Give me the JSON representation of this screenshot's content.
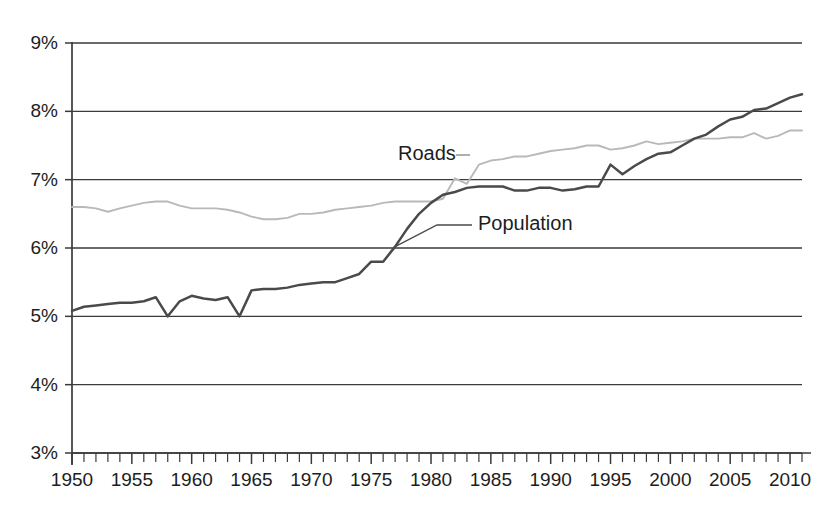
{
  "chart_data": {
    "type": "line",
    "title": "",
    "subtitle": "",
    "xlabel": "",
    "ylabel": "",
    "xlim": [
      1950,
      2011
    ],
    "ylim": [
      3,
      9
    ],
    "grid": true,
    "grid_axis": "y",
    "legend_position": "inline-annotations",
    "y_tick_labels": [
      "9%",
      "8%",
      "7%",
      "6%",
      "5%",
      "4%",
      "3%"
    ],
    "y_tick_values": [
      9,
      8,
      7,
      6,
      5,
      4,
      3
    ],
    "x_tick_labels": [
      "1950",
      "1955",
      "1960",
      "1965",
      "1970",
      "1975",
      "1980",
      "1985",
      "1990",
      "1995",
      "2000",
      "2005",
      "2010"
    ],
    "x_tick_values": [
      1950,
      1955,
      1960,
      1965,
      1970,
      1975,
      1980,
      1985,
      1990,
      1995,
      2000,
      2005,
      2010
    ],
    "x_minor_tick_step": 1,
    "y_unit": "percent",
    "x": [
      1950,
      1951,
      1952,
      1953,
      1954,
      1955,
      1956,
      1957,
      1958,
      1959,
      1960,
      1961,
      1962,
      1963,
      1964,
      1965,
      1966,
      1967,
      1968,
      1969,
      1970,
      1971,
      1972,
      1973,
      1974,
      1975,
      1976,
      1977,
      1978,
      1979,
      1980,
      1981,
      1982,
      1983,
      1984,
      1985,
      1986,
      1987,
      1988,
      1989,
      1990,
      1991,
      1992,
      1993,
      1994,
      1995,
      1996,
      1997,
      1998,
      1999,
      2000,
      2001,
      2002,
      2003,
      2004,
      2005,
      2006,
      2007,
      2008,
      2009,
      2010,
      2011
    ],
    "series": [
      {
        "name": "Roads",
        "color": "#b9b9b9",
        "annotation_label": "Roads",
        "values": [
          6.6,
          6.6,
          6.58,
          6.53,
          6.58,
          6.62,
          6.66,
          6.68,
          6.68,
          6.62,
          6.58,
          6.58,
          6.58,
          6.56,
          6.52,
          6.46,
          6.42,
          6.42,
          6.44,
          6.5,
          6.5,
          6.52,
          6.56,
          6.58,
          6.6,
          6.62,
          6.66,
          6.68,
          6.68,
          6.68,
          6.68,
          6.72,
          7.02,
          6.94,
          7.22,
          7.28,
          7.3,
          7.34,
          7.34,
          7.38,
          7.42,
          7.44,
          7.46,
          7.5,
          7.5,
          7.44,
          7.46,
          7.5,
          7.56,
          7.52,
          7.54,
          7.56,
          7.6,
          7.6,
          7.6,
          7.62,
          7.62,
          7.68,
          7.6,
          7.64,
          7.72,
          7.72
        ]
      },
      {
        "name": "Population",
        "color": "#4a4a4a",
        "annotation_label": "Population",
        "values": [
          5.08,
          5.14,
          5.16,
          5.18,
          5.2,
          5.2,
          5.22,
          5.28,
          5.0,
          5.22,
          5.3,
          5.26,
          5.24,
          5.28,
          5.0,
          5.38,
          5.4,
          5.4,
          5.42,
          5.46,
          5.48,
          5.5,
          5.5,
          5.56,
          5.62,
          5.8,
          5.8,
          6.02,
          6.28,
          6.5,
          6.66,
          6.78,
          6.82,
          6.88,
          6.9,
          6.9,
          6.9,
          6.84,
          6.84,
          6.88,
          6.88,
          6.84,
          6.86,
          6.9,
          6.9,
          7.22,
          7.08,
          7.2,
          7.3,
          7.38,
          7.4,
          7.5,
          7.6,
          7.66,
          7.78,
          7.88,
          7.92,
          8.02,
          8.04,
          8.12,
          8.2,
          8.25
        ]
      }
    ],
    "annotations": [
      {
        "text": "Roads",
        "series": "Roads"
      },
      {
        "text": "Population",
        "series": "Population"
      }
    ]
  }
}
